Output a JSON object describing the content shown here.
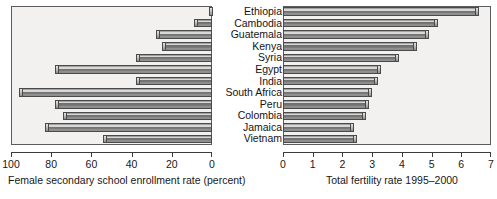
{
  "chart_data": [
    {
      "type": "bar",
      "orientation": "horizontal",
      "panel": "left",
      "title": "",
      "xlabel": "Female secondary school enrollment rate (percent)",
      "ylabel": "",
      "xlim": [
        100,
        0
      ],
      "reversed_x": true,
      "xticks": [
        100,
        80,
        60,
        40,
        20,
        0
      ],
      "xtick_labels": [
        "100",
        "80",
        "60",
        "40",
        "20",
        "0"
      ],
      "grid": false,
      "legend": "none",
      "categories": [
        "Ethiopia",
        "Cambodia",
        "Guatemala",
        "Kenya",
        "Syria",
        "Egypt",
        "India",
        "South Africa",
        "Peru",
        "Colombia",
        "Jamaica",
        "Vietnam"
      ],
      "values": [
        1,
        9,
        28,
        25,
        38,
        78,
        38,
        96,
        78,
        74,
        83,
        54
      ]
    },
    {
      "type": "bar",
      "orientation": "horizontal",
      "panel": "right",
      "title": "",
      "xlabel": "Total fertility rate 1995–2000",
      "ylabel": "",
      "xlim": [
        0,
        7
      ],
      "reversed_x": false,
      "xticks": [
        0,
        1,
        2,
        3,
        4,
        5,
        6,
        7
      ],
      "xtick_labels": [
        "0",
        "1",
        "2",
        "3",
        "4",
        "5",
        "6",
        "7"
      ],
      "grid": false,
      "legend": "none",
      "categories": [
        "Ethiopia",
        "Cambodia",
        "Guatemala",
        "Kenya",
        "Syria",
        "Egypt",
        "India",
        "South Africa",
        "Peru",
        "Colombia",
        "Jamaica",
        "Vietnam"
      ],
      "values": [
        6.6,
        5.2,
        4.9,
        4.5,
        3.9,
        3.3,
        3.2,
        3.0,
        2.9,
        2.8,
        2.4,
        2.5
      ]
    }
  ],
  "categories": [
    "Ethiopia",
    "Cambodia",
    "Guatemala",
    "Kenya",
    "Syria",
    "Egypt",
    "India",
    "South Africa",
    "Peru",
    "Colombia",
    "Jamaica",
    "Vietnam"
  ],
  "left_panel": {
    "xlabel": "Female secondary school enrollment rate (percent)",
    "tick_labels": [
      "100",
      "80",
      "60",
      "40",
      "20",
      "0"
    ]
  },
  "right_panel": {
    "xlabel": "Total fertility rate 1995–2000",
    "tick_labels": [
      "0",
      "1",
      "2",
      "3",
      "4",
      "5",
      "6",
      "7"
    ]
  },
  "style": {
    "bar_fill": "#757575",
    "bar_edge": "#4a4a4a",
    "plot_background": "#f2f1ef",
    "axis_color": "#3d3d3d",
    "text_color": "#171717"
  }
}
